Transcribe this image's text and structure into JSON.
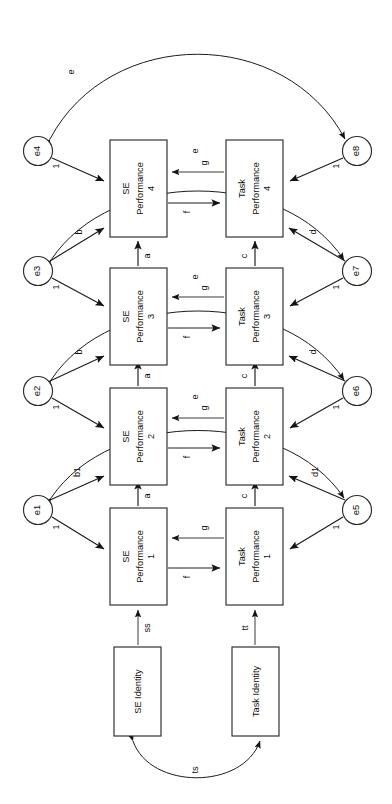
{
  "figure": {
    "kind": "sem-path-diagram",
    "orientation": "rotated-90-ccw",
    "background": "#ffffff",
    "line_color": "#1c1c1c",
    "box_fill": "#ffffff"
  },
  "latent_boxes": [
    {
      "id": "se4",
      "line1": "SE",
      "line2": "Performance",
      "line3": "4"
    },
    {
      "id": "se3",
      "line1": "SE",
      "line2": "Performance",
      "line3": "3"
    },
    {
      "id": "se2",
      "line1": "SE",
      "line2": "Performance",
      "line3": "2"
    },
    {
      "id": "se1",
      "line1": "SE",
      "line2": "Performance",
      "line3": "1"
    },
    {
      "id": "task4",
      "line1": "Task",
      "line2": "Performance",
      "line3": "4"
    },
    {
      "id": "task3",
      "line1": "Task",
      "line2": "Performance",
      "line3": "3"
    },
    {
      "id": "task2",
      "line1": "Task",
      "line2": "Performance",
      "line3": "2"
    },
    {
      "id": "task1",
      "line1": "Task",
      "line2": "Performance",
      "line3": "1"
    }
  ],
  "identity_boxes": [
    {
      "id": "se_identity",
      "label": "SE Identity"
    },
    {
      "id": "task_identity",
      "label": "Task Identity"
    }
  ],
  "error_circles": [
    {
      "id": "e4",
      "label": "e4",
      "side": "left",
      "loading": "1"
    },
    {
      "id": "e3",
      "label": "e3",
      "side": "left",
      "loading": "1"
    },
    {
      "id": "e2",
      "label": "e2",
      "side": "left",
      "loading": "1"
    },
    {
      "id": "e1",
      "label": "e1",
      "side": "left",
      "loading": "1"
    },
    {
      "id": "e8",
      "label": "e8",
      "side": "right",
      "loading": "1"
    },
    {
      "id": "e7",
      "label": "e7",
      "side": "right",
      "loading": "1"
    },
    {
      "id": "e6",
      "label": "e6",
      "side": "right",
      "loading": "1"
    },
    {
      "id": "e5",
      "label": "e5",
      "side": "right",
      "loading": "1"
    }
  ],
  "path_labels": {
    "se_autoregressive": [
      "a",
      "a",
      "a"
    ],
    "task_autoregressive": [
      "c",
      "c",
      "c"
    ],
    "se_to_task": [
      "f",
      "f",
      "f",
      "f"
    ],
    "task_to_se": [
      "g",
      "g",
      "g",
      "g"
    ],
    "error_cross_left": [
      "b",
      "b",
      "b1"
    ],
    "error_cross_right": [
      "d",
      "d",
      "d1"
    ],
    "error_correlations": [
      "e",
      "e",
      "e",
      "e"
    ],
    "identity_to_perf_se": "ss",
    "identity_to_perf_task": "tt",
    "identity_correlation": "ts"
  },
  "legend_note": ""
}
